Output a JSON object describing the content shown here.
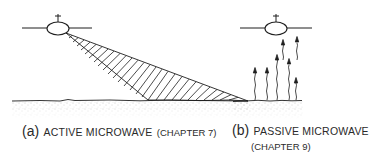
{
  "figure": {
    "panels": [
      {
        "id": "a",
        "letter": "(a)",
        "title": "ACTIVE MICROWAVE",
        "chapter": "(CHAPTER 7)",
        "description": "Satellite emits a slanted beam that illuminates the ground surface"
      },
      {
        "id": "b",
        "letter": "(b)",
        "title": "PASSIVE MICROWAVE",
        "chapter": "(CHAPTER 9)",
        "description": "Satellite receives naturally emitted upward wavy radiation from the ground"
      }
    ],
    "colors": {
      "line": "#1e1e1e",
      "ground_stipple": "#8a8a8a",
      "text": "#2a2a2a",
      "background": "#ffffff"
    }
  }
}
